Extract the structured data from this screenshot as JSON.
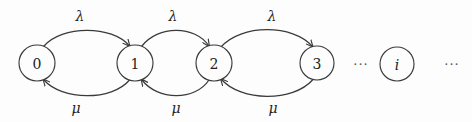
{
  "diagram": {
    "kind": "state-transition-diagram",
    "title": "",
    "background_color": "#fdfdfd",
    "stroke_color": "#3a3a3a",
    "text_color": "#222222"
  },
  "states": [
    {
      "id": "s0",
      "label": "0",
      "cx": 37,
      "cy": 63,
      "r": 18,
      "italic": false
    },
    {
      "id": "s1",
      "label": "1",
      "cx": 135,
      "cy": 63,
      "r": 18,
      "italic": false
    },
    {
      "id": "s2",
      "label": "2",
      "cx": 214,
      "cy": 63,
      "r": 18,
      "italic": false
    },
    {
      "id": "s3",
      "label": "3",
      "cx": 317,
      "cy": 63,
      "r": 17,
      "italic": false
    },
    {
      "id": "si",
      "label": "i",
      "cx": 397,
      "cy": 64,
      "r": 17,
      "italic": true
    }
  ],
  "forward_edges": [
    {
      "id": "e01",
      "from": "0",
      "to": "1",
      "rate": "λ",
      "label_x": 80,
      "label_y": 16
    },
    {
      "id": "e12",
      "from": "1",
      "to": "2",
      "rate": "λ",
      "label_x": 173,
      "label_y": 16
    },
    {
      "id": "e23",
      "from": "2",
      "to": "3",
      "rate": "λ",
      "label_x": 272,
      "label_y": 16
    }
  ],
  "backward_edges": [
    {
      "id": "e10",
      "from": "1",
      "to": "0",
      "rate": "μ",
      "label_x": 76,
      "label_y": 108
    },
    {
      "id": "e21",
      "from": "2",
      "to": "1",
      "rate": "μ",
      "label_x": 176,
      "label_y": 108
    },
    {
      "id": "e32",
      "from": "3",
      "to": "2",
      "rate": "μ",
      "label_x": 273,
      "label_y": 108
    }
  ],
  "ellipses": [
    {
      "id": "dots-left",
      "text": "···",
      "x": 361,
      "y": 64
    },
    {
      "id": "dots-right",
      "text": "···",
      "x": 452,
      "y": 64
    }
  ]
}
